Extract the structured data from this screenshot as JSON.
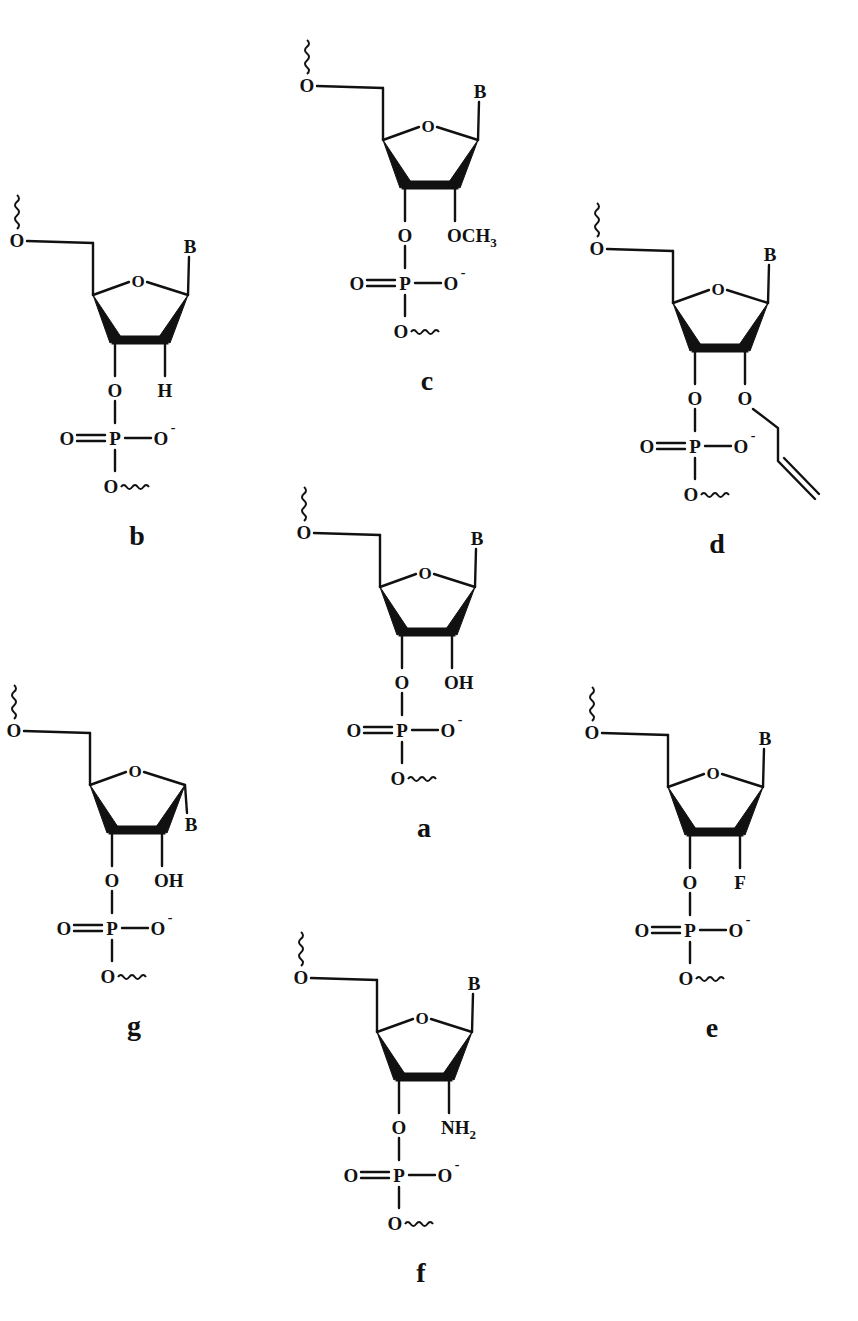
{
  "figure": {
    "background": "#ffffff",
    "ink_color": "#111111"
  },
  "common": {
    "ring_oxygen": "O",
    "base": "B",
    "five_prime_oxygen": "O",
    "three_prime_oxygen": "O",
    "phosphorus": "P",
    "phosphate_double_bond_oxygen": "O",
    "phosphate_anionic_oxygen": "O",
    "phosphate_charge": "-",
    "bridging_oxygen": "O"
  },
  "structures": [
    {
      "id": "a",
      "label": "a",
      "substituent": "OH",
      "sub_main": "OH",
      "sub_subscript": "",
      "base_orientation": "beta",
      "origin": [
        380,
        587
      ]
    },
    {
      "id": "b",
      "label": "b",
      "substituent": "H",
      "sub_main": "H",
      "sub_subscript": "",
      "base_orientation": "beta",
      "origin": [
        93,
        295
      ]
    },
    {
      "id": "c",
      "label": "c",
      "substituent": "OCH3",
      "sub_main": "OCH",
      "sub_subscript": "3",
      "base_orientation": "beta",
      "origin": [
        383,
        140
      ]
    },
    {
      "id": "d",
      "label": "d",
      "substituent": "O-allyl",
      "sub_main": "O",
      "sub_subscript": "",
      "base_orientation": "beta",
      "origin": [
        673,
        303
      ]
    },
    {
      "id": "e",
      "label": "e",
      "substituent": "F",
      "sub_main": "F",
      "sub_subscript": "",
      "base_orientation": "beta",
      "origin": [
        668,
        787
      ]
    },
    {
      "id": "f",
      "label": "f",
      "substituent": "NH2",
      "sub_main": "NH",
      "sub_subscript": "2",
      "base_orientation": "beta",
      "origin": [
        377,
        1032
      ]
    },
    {
      "id": "g",
      "label": "g",
      "substituent": "OH",
      "sub_main": "OH",
      "sub_subscript": "",
      "base_orientation": "alpha",
      "origin": [
        90,
        785
      ]
    }
  ]
}
